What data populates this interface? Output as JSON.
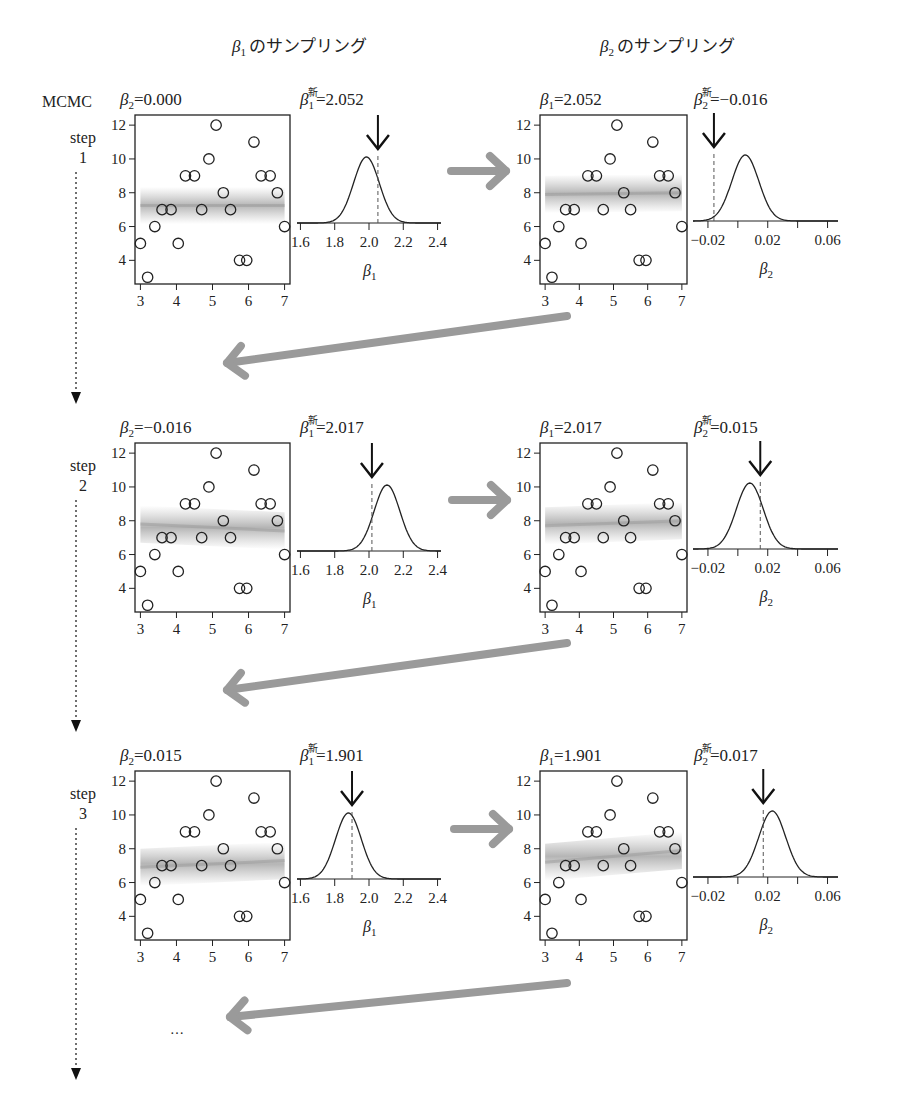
{
  "column_headers": [
    {
      "param": "β",
      "sub": "1",
      "text": "のサンプリング"
    },
    {
      "param": "β",
      "sub": "2",
      "text": "のサンプリング"
    }
  ],
  "row_header": {
    "top_label": "MCMC",
    "step_word": "step",
    "ellipsis": "…"
  },
  "colors": {
    "arrow_gray": "#9a9a9a",
    "band_gray": "#b8b8b8",
    "ink": "#222222"
  },
  "scatter_points": [
    [
      3.0,
      5
    ],
    [
      3.2,
      3
    ],
    [
      3.4,
      6
    ],
    [
      3.6,
      7
    ],
    [
      3.85,
      7
    ],
    [
      4.05,
      5
    ],
    [
      4.25,
      9
    ],
    [
      4.5,
      9
    ],
    [
      4.7,
      7
    ],
    [
      4.9,
      10
    ],
    [
      5.1,
      12
    ],
    [
      5.3,
      8
    ],
    [
      5.5,
      7
    ],
    [
      5.75,
      4
    ],
    [
      5.95,
      4
    ],
    [
      6.15,
      11
    ],
    [
      6.35,
      9
    ],
    [
      6.6,
      9
    ],
    [
      6.8,
      8
    ],
    [
      7.0,
      6
    ]
  ],
  "scatter_axes": {
    "x_ticks": [
      "3",
      "4",
      "5",
      "6",
      "7"
    ],
    "y_ticks": [
      "4",
      "6",
      "8",
      "10",
      "12"
    ],
    "xlim": [
      2.85,
      7.15
    ],
    "ylim": [
      2.6,
      12.6
    ]
  },
  "density_axes": {
    "beta1": {
      "ticks": [
        "1.6",
        "1.8",
        "2.0",
        "2.2",
        "2.4"
      ],
      "tick_values": [
        1.6,
        1.8,
        2.0,
        2.2,
        2.4
      ],
      "xlim": [
        1.58,
        2.42
      ],
      "xlabel_sub": "1"
    },
    "beta2": {
      "ticks": [
        "−0.02",
        "0.02",
        "0.06"
      ],
      "tick_values": [
        -0.02,
        0.0,
        0.02,
        0.04,
        0.06
      ],
      "labeled": [
        -0.02,
        0.02,
        0.06
      ],
      "xlim": [
        -0.03,
        0.067
      ],
      "xlabel_sub": "2"
    }
  },
  "steps": [
    {
      "number": "1",
      "beta1_sampling": {
        "fixed_label": "β2",
        "fixed_value": "0.000",
        "band_y_at_x3": 7.25,
        "band_y_at_x7": 7.25,
        "new_label": "β1新",
        "new_value": "2.052",
        "sampled": 2.052,
        "density_mean": 1.985,
        "density_sd": 0.075
      },
      "beta2_sampling": {
        "fixed_label": "β1",
        "fixed_value": "2.052",
        "band_y_at_x3": 7.9,
        "band_y_at_x7": 8.0,
        "new_label": "β2新",
        "new_value": "−0.016",
        "sampled": -0.016,
        "density_mean": 0.005,
        "density_sd": 0.009
      }
    },
    {
      "number": "2",
      "beta1_sampling": {
        "fixed_label": "β2",
        "fixed_value": "−0.016",
        "band_y_at_x3": 7.8,
        "band_y_at_x7": 7.4,
        "new_label": "β1新",
        "new_value": "2.017",
        "sampled": 2.017,
        "density_mean": 2.105,
        "density_sd": 0.075
      },
      "beta2_sampling": {
        "fixed_label": "β1",
        "fixed_value": "2.017",
        "band_y_at_x3": 7.7,
        "band_y_at_x7": 8.0,
        "new_label": "β2新",
        "new_value": "0.015",
        "sampled": 0.015,
        "density_mean": 0.008,
        "density_sd": 0.009
      }
    },
    {
      "number": "3",
      "beta1_sampling": {
        "fixed_label": "β2",
        "fixed_value": "0.015",
        "band_y_at_x3": 6.9,
        "band_y_at_x7": 7.3,
        "new_label": "β1新",
        "new_value": "1.901",
        "sampled": 1.901,
        "density_mean": 1.88,
        "density_sd": 0.075
      },
      "beta2_sampling": {
        "fixed_label": "β1",
        "fixed_value": "1.901",
        "band_y_at_x3": 7.2,
        "band_y_at_x7": 7.9,
        "new_label": "β2新",
        "new_value": "0.017",
        "sampled": 0.017,
        "density_mean": 0.023,
        "density_sd": 0.009
      }
    }
  ]
}
